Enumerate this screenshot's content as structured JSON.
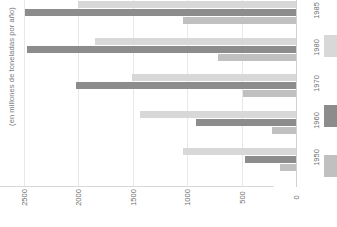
{
  "chart_data": {
    "type": "bar",
    "orientation": "horizontal",
    "title": "",
    "subtitle": "",
    "xlabel": "",
    "ylabel": "(en millones de toneladas por año)",
    "categories": [
      "1985",
      "1980",
      "1970",
      "1960",
      "1950"
    ],
    "xlim": [
      0,
      2500
    ],
    "x_reversed": true,
    "grid": true,
    "legend_position": "right",
    "xticks": [
      "2500",
      "2000",
      "1500",
      "1000",
      "500",
      "0"
    ],
    "xtick_values": [
      2500,
      2000,
      1500,
      1000,
      500,
      0
    ],
    "series": [
      {
        "name": "",
        "key": "light",
        "color": "#d8d8d8",
        "values": [
          2000,
          1850,
          1510,
          1430,
          1040
        ]
      },
      {
        "name": "",
        "key": "dark",
        "color": "#8c8c8c",
        "values": [
          2490,
          2470,
          2020,
          920,
          470
        ]
      },
      {
        "name": "",
        "key": "medium",
        "color": "#c0c0c0",
        "values": [
          1040,
          715,
          490,
          220,
          150
        ]
      }
    ]
  },
  "axis": {
    "y_title": "(en millones de toneladas por año)"
  },
  "ticks": {
    "x": [
      "2500",
      "2000",
      "1500",
      "1000",
      "500",
      "0"
    ],
    "y": [
      "1985",
      "1980",
      "1970",
      "1960",
      "1950"
    ]
  },
  "legend": {
    "items": [
      {
        "label": "",
        "color": "#d8d8d8"
      },
      {
        "label": "",
        "color": "#8c8c8c"
      },
      {
        "label": "",
        "color": "#c0c0c0"
      }
    ]
  },
  "colors": {
    "light": "#d8d8d8",
    "medium": "#c0c0c0",
    "dark": "#8c8c8c",
    "grid": "#e8e8e8",
    "axis": "#d0d0d0",
    "text": "#6e6e6e",
    "background": "#ffffff"
  }
}
